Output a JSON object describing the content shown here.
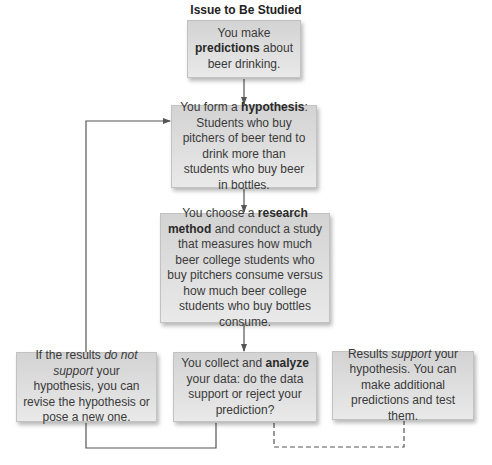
{
  "title": "Issue to Be Studied",
  "boxes": {
    "predictions": {
      "pre": "You make ",
      "bold": "predictions",
      "post": " about beer drinking."
    },
    "hypothesis": {
      "pre": "You form a ",
      "bold": "hypothesis",
      "post": ": Students who buy pitchers of beer tend to drink more than students who buy beer in bottles."
    },
    "method": {
      "pre": "You choose a ",
      "bold": "research method",
      "post": " and conduct a study that measures how much beer college students who buy pitchers consume versus how much beer college students who buy bottles consume."
    },
    "not_support": {
      "pre": "If the results ",
      "italic": "do not support",
      "post": " your hypothesis, you can revise the hypothesis or pose a new one."
    },
    "analyze": {
      "pre": "You collect and ",
      "bold": "analyze",
      "post": " your data: do the data support or reject your prediction?"
    },
    "support": {
      "pre": "Results ",
      "italic": "support",
      "post": " your hypothesis. You can make additional predictions and test them."
    }
  },
  "connectors": {
    "line_color": "#555555",
    "solid_path": "analyze-to-not_support-to-hypothesis",
    "dashed_path": "analyze-to-support"
  }
}
